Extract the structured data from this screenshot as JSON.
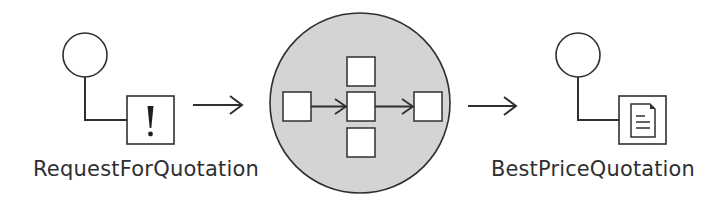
{
  "diagram": {
    "type": "process-flow",
    "colors": {
      "line": "#2f2f2f",
      "process_fill": "#d4d4d4",
      "background": "#ffffff",
      "box_fill": "#ffffff"
    },
    "input_message": {
      "label": "RequestForQuotation",
      "icon": "exclamation-icon",
      "glyph": "!"
    },
    "process": {
      "icon": "process-circle",
      "inner_steps": [
        "left-step",
        "top-step",
        "center-step",
        "bottom-step",
        "right-step"
      ],
      "inner_arrows": [
        "left-to-center",
        "center-to-right"
      ]
    },
    "output_message": {
      "label": "BestPriceQuotation",
      "icon": "document-icon"
    },
    "arrows": [
      "input-to-process",
      "process-to-output"
    ]
  }
}
